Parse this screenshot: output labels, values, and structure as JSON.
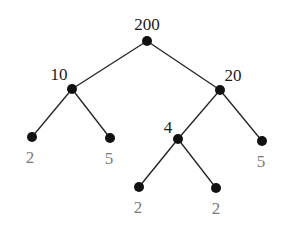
{
  "diagram": {
    "type": "factor-tree",
    "colors": {
      "internal_label": "#1a1a1a",
      "leaf_label": "#7a7a7a",
      "node": "#111111",
      "edge": "#222222"
    },
    "nodes": [
      {
        "id": "n200",
        "label": "200",
        "x": 147,
        "y": 41,
        "lx": 147,
        "ly": 30,
        "leaf": false
      },
      {
        "id": "n10",
        "label": "10",
        "x": 72,
        "y": 89,
        "lx": 59,
        "ly": 80,
        "leaf": false
      },
      {
        "id": "n20",
        "label": "20",
        "x": 220,
        "y": 90,
        "lx": 233,
        "ly": 81,
        "leaf": false
      },
      {
        "id": "n2a",
        "label": "2",
        "x": 32,
        "y": 137,
        "lx": 30,
        "ly": 163,
        "leaf": true
      },
      {
        "id": "n5a",
        "label": "5",
        "x": 110,
        "y": 138,
        "lx": 109,
        "ly": 164,
        "leaf": true
      },
      {
        "id": "n4",
        "label": "4",
        "x": 178,
        "y": 139,
        "lx": 168,
        "ly": 133,
        "leaf": false
      },
      {
        "id": "n5b",
        "label": "5",
        "x": 262,
        "y": 141,
        "lx": 261,
        "ly": 167,
        "leaf": true
      },
      {
        "id": "n2b",
        "label": "2",
        "x": 139,
        "y": 187,
        "lx": 138,
        "ly": 213,
        "leaf": true
      },
      {
        "id": "n2c",
        "label": "2",
        "x": 216,
        "y": 188,
        "lx": 216,
        "ly": 214,
        "leaf": true
      }
    ],
    "edges": [
      [
        "n200",
        "n10"
      ],
      [
        "n200",
        "n20"
      ],
      [
        "n10",
        "n2a"
      ],
      [
        "n10",
        "n5a"
      ],
      [
        "n20",
        "n4"
      ],
      [
        "n20",
        "n5b"
      ],
      [
        "n4",
        "n2b"
      ],
      [
        "n4",
        "n2c"
      ]
    ]
  }
}
